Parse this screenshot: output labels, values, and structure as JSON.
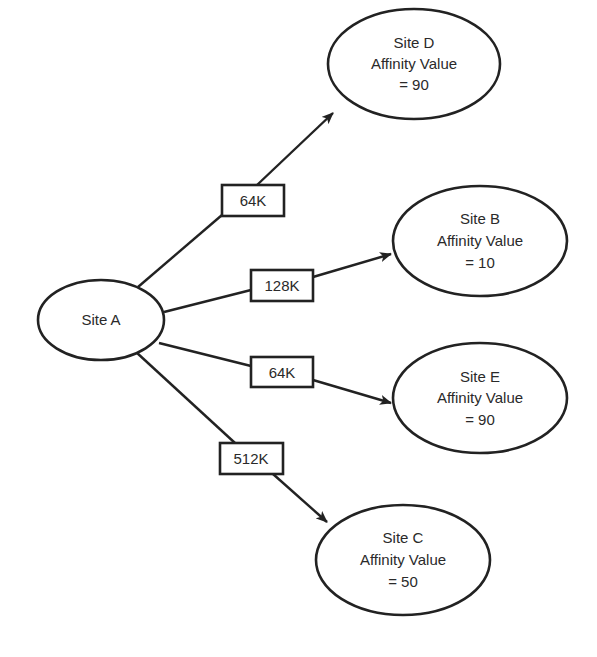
{
  "diagram": {
    "nodes": [
      {
        "id": "A",
        "lines": [
          "Site A"
        ]
      },
      {
        "id": "D",
        "lines": [
          "Site D",
          "Affinity Value",
          "= 90"
        ]
      },
      {
        "id": "B",
        "lines": [
          "Site B",
          "Affinity Value",
          "= 10"
        ]
      },
      {
        "id": "E",
        "lines": [
          "Site E",
          "Affinity Value",
          "= 90"
        ]
      },
      {
        "id": "C",
        "lines": [
          "Site C",
          "Affinity Value",
          "= 50"
        ]
      }
    ],
    "edges": [
      {
        "from": "A",
        "to": "D",
        "label": "64K"
      },
      {
        "from": "A",
        "to": "B",
        "label": "128K"
      },
      {
        "from": "A",
        "to": "E",
        "label": "64K"
      },
      {
        "from": "A",
        "to": "C",
        "label": "512K"
      }
    ]
  }
}
